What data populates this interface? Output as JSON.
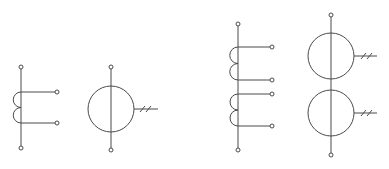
{
  "diagram": {
    "title": "",
    "stroke_color": "#4a4a4a",
    "background": "#ffffff",
    "symbols": [
      {
        "id": "single-ct-winding",
        "type": "tapped-coil",
        "spine_x": 21,
        "top_terminal_y": 67,
        "bottom_terminal_y": 148,
        "coils": [
          {
            "start_y": 92,
            "end_y": 123,
            "turns": 2,
            "tap_terminal_x": 57
          }
        ]
      },
      {
        "id": "single-ct-circle",
        "type": "current-transformer-circle",
        "cx": 111,
        "cy": 109,
        "r": 23,
        "top_terminal_y": 67,
        "bottom_terminal_y": 150,
        "lead_end_x": 158,
        "slash_count": 2
      },
      {
        "id": "double-ct-winding",
        "type": "tapped-coil",
        "spine_x": 238,
        "top_terminal_y": 24,
        "bottom_terminal_y": 150,
        "coils": [
          {
            "start_y": 47,
            "end_y": 80,
            "turns": 2,
            "tap_terminal_x": 272
          },
          {
            "start_y": 94,
            "end_y": 126,
            "turns": 2,
            "tap_terminal_x": 272
          }
        ]
      },
      {
        "id": "double-ct-circles",
        "type": "current-transformer-circle-pair",
        "cx": 331,
        "circles": [
          {
            "cy": 56,
            "r": 23,
            "lead_end_x": 377,
            "slash_count": 2
          },
          {
            "cy": 113,
            "r": 23,
            "lead_end_x": 377,
            "slash_count": 2
          }
        ],
        "top_terminal_y": 15,
        "bottom_terminal_y": 155
      }
    ]
  }
}
